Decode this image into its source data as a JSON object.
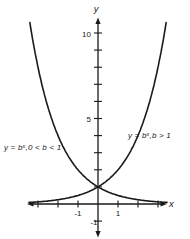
{
  "figure": {
    "background_color": "#ffffff",
    "ink_color": "#1a1a1a"
  },
  "chart_data": {
    "type": "line",
    "title": "",
    "xlabel": "x",
    "ylabel": "y",
    "grid": false,
    "legend_position": "inline-annotations",
    "x_range": [
      -3.45,
      3.45
    ],
    "y_range": [
      -1.6,
      11.6
    ],
    "x_ticks": [
      -3,
      -2,
      -1,
      1,
      2,
      3
    ],
    "x_tick_labels": [
      {
        "value": -1,
        "label": "-1"
      },
      {
        "value": 1,
        "label": "1"
      }
    ],
    "y_ticks": [
      -1,
      1,
      2,
      3,
      4,
      5,
      6,
      7,
      8,
      9,
      10
    ],
    "y_tick_labels": [
      {
        "value": -1,
        "label": "-1"
      },
      {
        "value": 5,
        "label": "5"
      },
      {
        "value": 10,
        "label": "10"
      }
    ],
    "series": [
      {
        "name": "decreasing-exponential",
        "base": 0.5,
        "label_prefix": "y = b",
        "label_sup": "x",
        "label_suffix": ",0 < b < 1"
      },
      {
        "name": "increasing-exponential",
        "base": 2,
        "label_prefix": "y = b",
        "label_sup": "x",
        "label_suffix": ",b > 1"
      }
    ],
    "intersection_point": {
      "x": 0,
      "y": 1
    },
    "y_clip_max": 10.85
  }
}
